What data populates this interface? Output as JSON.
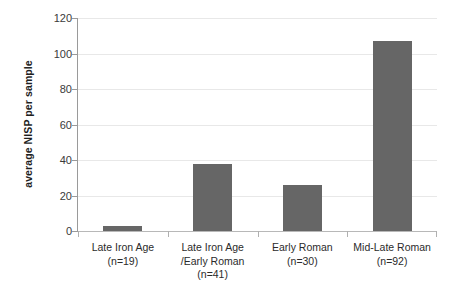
{
  "chart_data": {
    "type": "bar",
    "title": "",
    "xlabel": "",
    "ylabel": "average NISP per sample",
    "categories": [
      "Late Iron Age (n=19)",
      "Late Iron Age /Early Roman (n=41)",
      "Early Roman (n=30)",
      "Mid-Late Roman (n=92)"
    ],
    "category_lines": [
      [
        "Late Iron Age",
        "(n=19)"
      ],
      [
        "Late Iron Age",
        "/Early Roman",
        "(n=41)"
      ],
      [
        "Early Roman",
        "(n=30)"
      ],
      [
        "Mid-Late Roman",
        "(n=92)"
      ]
    ],
    "sample_counts": [
      19,
      41,
      30,
      92
    ],
    "values": [
      3,
      38,
      26,
      107
    ],
    "ylim": [
      0,
      120
    ],
    "yticks": [
      0,
      20,
      40,
      60,
      80,
      100,
      120
    ],
    "ytick_labels": [
      "0",
      "20",
      "40",
      "60",
      "80",
      "100",
      "120"
    ],
    "grid": true,
    "legend": false,
    "legend_position": "none",
    "bar_color": "#666666",
    "gridline_color": "#e8e8e8",
    "axis_color": "#9a9a9a",
    "background_color": "#ffffff"
  }
}
